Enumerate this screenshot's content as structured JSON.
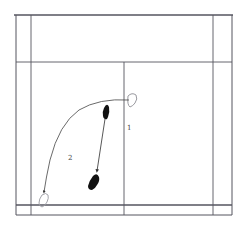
{
  "diagram": {
    "type": "badminton-half-court-footwork",
    "colors": {
      "line": "#55555f",
      "footprint_filled": "#111111",
      "footprint_outline": "#9a9aa0",
      "path": "#444444"
    },
    "labels": [
      {
        "id": "movement-1",
        "text": "1"
      },
      {
        "id": "movement-2",
        "text": "2"
      }
    ]
  }
}
